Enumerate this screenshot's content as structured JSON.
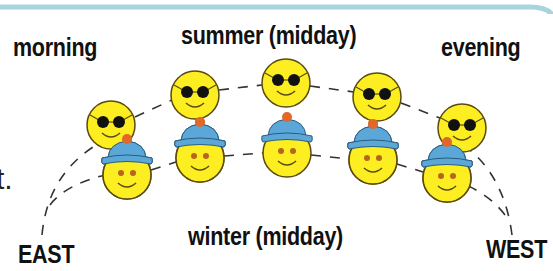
{
  "diagram": {
    "labels": {
      "morning": "morning",
      "summer": "summer (midday)",
      "evening": "evening",
      "winter": "winter (midday)",
      "east": "EAST",
      "west": "WEST"
    },
    "cropped_text_fragment": "t.",
    "summer_path": {
      "name": "summer",
      "icon": "sun-face-with-sunglasses-icon",
      "points": [
        {
          "x": 111,
          "y": 125
        },
        {
          "x": 195,
          "y": 95
        },
        {
          "x": 286,
          "y": 83
        },
        {
          "x": 377,
          "y": 97
        },
        {
          "x": 462,
          "y": 128
        }
      ]
    },
    "winter_path": {
      "name": "winter",
      "icon": "sun-face-with-hat-icon",
      "points": [
        {
          "x": 127,
          "y": 175
        },
        {
          "x": 200,
          "y": 158
        },
        {
          "x": 287,
          "y": 153
        },
        {
          "x": 373,
          "y": 160
        },
        {
          "x": 447,
          "y": 178
        }
      ]
    },
    "colors": {
      "face_fill": "#fcee21",
      "face_stroke": "#5a4a10",
      "glasses": "#111111",
      "hat": "#5aa7d8",
      "hat_pompom": "#e2672b",
      "eyes_winter": "#b5651d",
      "dash": "#333333",
      "top_border": "#a8d3df"
    }
  }
}
